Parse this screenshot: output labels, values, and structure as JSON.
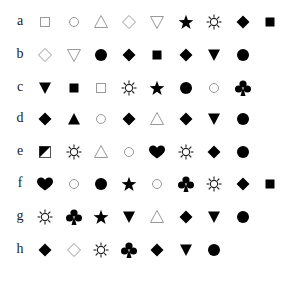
{
  "layout": {
    "col_x": [
      45,
      74,
      101,
      129,
      157,
      186,
      214,
      243,
      270
    ],
    "label_x": 20,
    "row_y": [
      22,
      55,
      88,
      119,
      152,
      184,
      217,
      250
    ]
  },
  "colors": {
    "filled": "#000000",
    "outline": "#999999",
    "label": "#222222"
  },
  "rows": [
    {
      "label": "a",
      "symbols": [
        "square-outline",
        "circle-outline",
        "triangle-up-outline",
        "diamond-outline",
        "triangle-down-outline",
        "star-filled",
        "sun-outline",
        "diamond-filled",
        "square-filled"
      ]
    },
    {
      "label": "b",
      "symbols": [
        "diamond-outline",
        "triangle-down-outline",
        "circle-filled",
        "diamond-filled",
        "square-filled",
        "diamond-filled",
        "triangle-down-filled",
        "circle-filled"
      ]
    },
    {
      "label": "c",
      "symbols": [
        "triangle-down-filled",
        "square-filled",
        "square-outline",
        "sun-outline",
        "star-filled",
        "circle-filled",
        "circle-outline",
        "club-filled"
      ]
    },
    {
      "label": "d",
      "symbols": [
        "diamond-filled",
        "triangle-up-filled",
        "circle-outline",
        "diamond-filled",
        "triangle-up-outline",
        "diamond-filled",
        "triangle-down-filled",
        "circle-filled"
      ]
    },
    {
      "label": "e",
      "symbols": [
        "square-half-filled",
        "sun-outline",
        "triangle-up-outline",
        "circle-outline",
        "heart-filled",
        "sun-outline",
        "diamond-filled",
        "circle-filled"
      ]
    },
    {
      "label": "f",
      "symbols": [
        "heart-filled",
        "circle-outline",
        "circle-filled",
        "star-filled",
        "circle-outline",
        "club-filled",
        "sun-outline",
        "diamond-filled",
        "square-filled"
      ]
    },
    {
      "label": "g",
      "symbols": [
        "sun-outline",
        "club-filled",
        "star-filled",
        "triangle-down-filled",
        "triangle-up-outline",
        "diamond-filled",
        "triangle-down-filled",
        "circle-filled"
      ]
    },
    {
      "label": "h",
      "symbols": [
        "diamond-filled",
        "diamond-outline",
        "sun-outline",
        "club-filled",
        "diamond-filled",
        "triangle-down-filled",
        "circle-filled"
      ]
    }
  ]
}
